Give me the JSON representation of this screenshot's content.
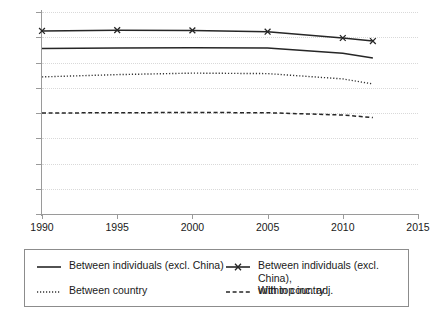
{
  "chart_data": {
    "type": "line",
    "title": "",
    "subtitle": "",
    "xlabel": "",
    "ylabel": "",
    "xlim": [
      1990,
      2015
    ],
    "ylim": [
      0.0,
      0.8
    ],
    "grid": "horizontal-dotted",
    "legend_position": "bottom",
    "x_ticks": [
      "1990",
      "1995",
      "2000",
      "2005",
      "2010",
      "2015"
    ],
    "x_tick_values": [
      1990,
      1995,
      2000,
      2005,
      2010,
      2015
    ],
    "y_ticks": [
      "0.00",
      "0.10",
      "0.20",
      "0.30",
      "0.40",
      "0.50",
      "0.60",
      "0.70",
      "0.80"
    ],
    "y_tick_values": [
      0.0,
      0.1,
      0.2,
      0.3,
      0.4,
      0.5,
      0.6,
      0.7,
      0.8
    ],
    "x": [
      1990,
      1995,
      2000,
      2005,
      2010,
      2012
    ],
    "series": [
      {
        "name": "Between individuals (excl. China), with top inc. adj.",
        "style": "solid-with-markers",
        "marker": "x",
        "color": "#262626",
        "values": [
          0.725,
          0.728,
          0.727,
          0.722,
          0.697,
          0.685
        ]
      },
      {
        "name": "Between individuals (excl. China)",
        "style": "solid",
        "marker": "none",
        "color": "#262626",
        "values": [
          0.655,
          0.657,
          0.658,
          0.657,
          0.637,
          0.618
        ]
      },
      {
        "name": "Between country",
        "style": "dotted",
        "marker": "none",
        "color": "#333333",
        "values": [
          0.543,
          0.552,
          0.558,
          0.556,
          0.535,
          0.515
        ]
      },
      {
        "name": "Within country",
        "style": "dashed",
        "marker": "none",
        "color": "#262626",
        "values": [
          0.4,
          0.401,
          0.402,
          0.401,
          0.392,
          0.382
        ]
      }
    ]
  },
  "legend": {
    "entries": [
      {
        "label": "Between individuals (excl. China)",
        "style": "solid"
      },
      {
        "label": "Between individuals (excl. China),\nwith top inc. adj.",
        "style": "solid-with-markers"
      },
      {
        "label": "Between country",
        "style": "dotted"
      },
      {
        "label": "Within country",
        "style": "dashed"
      }
    ]
  }
}
